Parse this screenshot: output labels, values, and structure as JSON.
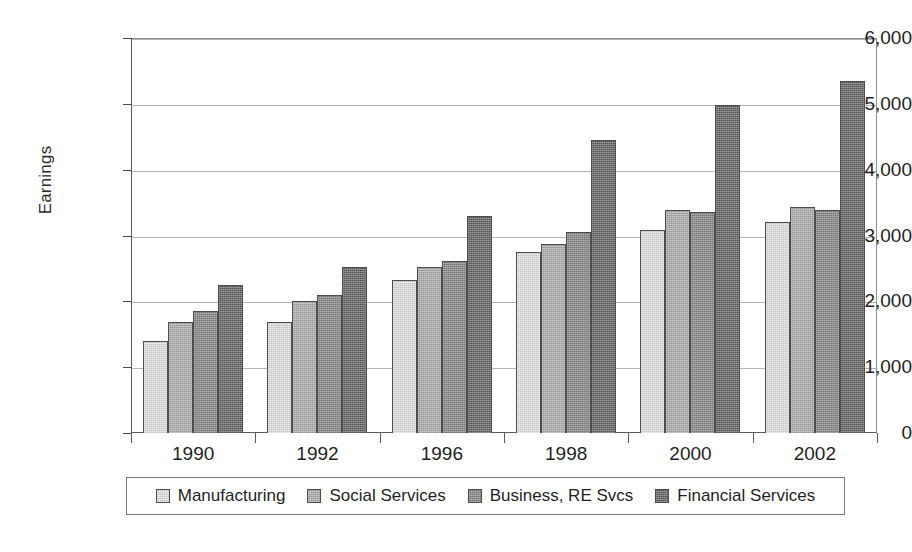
{
  "chart_data": {
    "type": "bar",
    "title": "",
    "xlabel": "",
    "ylabel": "Earnings",
    "ylim": [
      0,
      6000
    ],
    "ytick_labels": [
      "0",
      "1,000",
      "2,000",
      "3,000",
      "4,000",
      "5,000",
      "6,000"
    ],
    "ytick_values": [
      0,
      1000,
      2000,
      3000,
      4000,
      5000,
      6000
    ],
    "grid": true,
    "legend_position": "bottom",
    "categories": [
      "1990",
      "1992",
      "1996",
      "1998",
      "2000",
      "2002"
    ],
    "series": [
      {
        "name": "Manufacturing",
        "color": "#dedede",
        "values": [
          1400,
          1680,
          2320,
          2750,
          3090,
          3200
        ]
      },
      {
        "name": "Social Services",
        "color": "#a8a8a8",
        "values": [
          1680,
          2000,
          2520,
          2875,
          3390,
          3430
        ]
      },
      {
        "name": "Business, RE Svcs",
        "color": "#808080",
        "values": [
          1850,
          2100,
          2620,
          3050,
          3350,
          3380
        ]
      },
      {
        "name": "Financial Services",
        "color": "#5c5c5c",
        "values": [
          2250,
          2520,
          3300,
          4450,
          4975,
          5350
        ]
      }
    ]
  }
}
